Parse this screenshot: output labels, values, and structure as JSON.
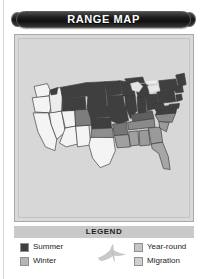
{
  "title": {
    "text": "RANGE MAP"
  },
  "map": {
    "alt_name": "united-states-range-map",
    "background_color": "#d7d7d7",
    "border_color": "#a8a8a8",
    "state_outline_color": "#3a3a3a"
  },
  "legend": {
    "header": "LEGEND",
    "bird_icon": "flying-bird-icon",
    "items": [
      {
        "label": "Summer",
        "color": "#3f3f3f",
        "column": "left",
        "key": "summer"
      },
      {
        "label": "Winter",
        "color": "#b5b5b5",
        "column": "left",
        "key": "winter"
      },
      {
        "label": "Year-round",
        "color": "#c6c6c6",
        "column": "right",
        "key": "year-round"
      },
      {
        "label": "Migration",
        "color": "#cfcfcf",
        "column": "right",
        "key": "migration"
      }
    ]
  },
  "colors": {
    "summer_fill": "#3f3f3f",
    "winter_fill": "#b5b5b5",
    "year_round_fill": "#9a9a9a",
    "migration_fill": "#f2f2f2",
    "panel_bg": "#d7d7d7",
    "banner_bg": "#151515",
    "banner_text": "#ffffff",
    "legend_header_bg": "#c9c9c9"
  }
}
